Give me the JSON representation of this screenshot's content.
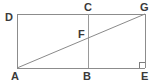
{
  "figure": {
    "type": "geometry-diagram",
    "canvas": {
      "width": 161,
      "height": 83
    },
    "colors": {
      "background": "#ffffff",
      "stroke": "#8c8c8c",
      "diagonal_stroke": "#8a8a8a",
      "label_color": "#3a3a3a"
    },
    "points": {
      "A": {
        "label": "A",
        "x": 17,
        "y": 68,
        "label_x": 11,
        "label_y": 71
      },
      "B": {
        "label": "B",
        "x": 88,
        "y": 68,
        "label_x": 83,
        "label_y": 71
      },
      "C": {
        "label": "C",
        "x": 88,
        "y": 14,
        "label_x": 84,
        "label_y": 2
      },
      "D": {
        "label": "D",
        "x": 17,
        "y": 14,
        "label_x": 5,
        "label_y": 12
      },
      "E": {
        "label": "E",
        "x": 145,
        "y": 68,
        "label_x": 141,
        "label_y": 71
      },
      "F": {
        "label": "F",
        "x": 88,
        "y": 37,
        "label_x": 78,
        "label_y": 29
      },
      "G": {
        "label": "G",
        "x": 145,
        "y": 14,
        "label_x": 140,
        "label_y": 2
      }
    },
    "segments": [
      {
        "name": "top-edge-DG",
        "from": "D",
        "to": "G"
      },
      {
        "name": "bottom-edge-AE",
        "from": "A",
        "to": "E"
      },
      {
        "name": "left-edge-DA",
        "from": "D",
        "to": "A"
      },
      {
        "name": "right-edge-GE",
        "from": "G",
        "to": "E"
      },
      {
        "name": "midline-CB",
        "from": "C",
        "to": "B"
      },
      {
        "name": "diagonal-AG",
        "from": "A",
        "to": "G"
      }
    ],
    "right_angle_marker": {
      "name": "right-angle-at-E",
      "at": "E",
      "size": 6
    }
  }
}
